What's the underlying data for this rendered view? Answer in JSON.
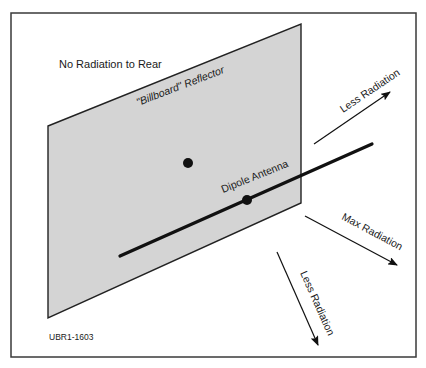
{
  "figure": {
    "id_label": "UBR1-1603",
    "rear_label": "No Radiation to Rear",
    "reflector_label": "\"Billboard\" Reflector",
    "antenna_label": "Dipole Antenna",
    "arrows": [
      {
        "name": "upper",
        "label": "Less Radiation"
      },
      {
        "name": "max",
        "label": "Max Radiation"
      },
      {
        "name": "lower",
        "label": "Less Radiation"
      }
    ]
  },
  "colors": {
    "frame": "#3a3a3a",
    "reflector_fill": "#d4d4d4",
    "reflector_edge": "#222222",
    "ink": "#111111",
    "text": "#1a1a1a"
  }
}
